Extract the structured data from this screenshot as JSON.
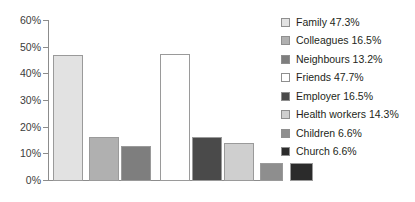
{
  "chart_data": {
    "type": "bar",
    "title": "",
    "xlabel": "",
    "ylabel": "",
    "ylim": [
      0,
      60
    ],
    "grid": false,
    "legend_position": "right",
    "ytick_labels": [
      "60%",
      "50%",
      "40%",
      "30%",
      "20%",
      "10%",
      "0%"
    ],
    "ytick_values": [
      60,
      50,
      40,
      30,
      20,
      10,
      0
    ],
    "categories": [
      "Family",
      "Colleagues",
      "Neighbours",
      "Friends",
      "Employer",
      "Health workers",
      "Children",
      "Church"
    ],
    "values": [
      47.3,
      16.5,
      13.2,
      47.7,
      16.5,
      14.3,
      6.6,
      6.6
    ],
    "value_labels": [
      "47.3%",
      "16.5%",
      "13.2%",
      "47.7%",
      "16.5%",
      "14.3%",
      "6.6%",
      "6.6%"
    ],
    "colors": [
      "#e2e2e2",
      "#b0b0b0",
      "#7e7e7e",
      "#ffffff",
      "#4a4a4a",
      "#cfcfcf",
      "#8e8e8e",
      "#2b2b2b"
    ],
    "legend_entries": [
      {
        "label": "Family 47.3%",
        "color": "#e2e2e2"
      },
      {
        "label": "Colleagues 16.5%",
        "color": "#b0b0b0"
      },
      {
        "label": "Neighbours 13.2%",
        "color": "#7e7e7e"
      },
      {
        "label": "Friends 47.7%",
        "color": "#ffffff"
      },
      {
        "label": "Employer 16.5%",
        "color": "#4a4a4a"
      },
      {
        "label": "Health workers 14.3%",
        "color": "#cfcfcf"
      },
      {
        "label": "Children 6.6%",
        "color": "#8e8e8e"
      },
      {
        "label": "Church 6.6%",
        "color": "#2b2b2b"
      }
    ],
    "bar_layout": [
      {
        "left": 5,
        "width": 30
      },
      {
        "left": 41,
        "width": 30
      },
      {
        "left": 73,
        "width": 30
      },
      {
        "left": 112,
        "width": 30
      },
      {
        "left": 144,
        "width": 30
      },
      {
        "left": 176,
        "width": 30
      },
      {
        "left": 212,
        "width": 23
      },
      {
        "left": 242,
        "width": 23
      }
    ]
  }
}
